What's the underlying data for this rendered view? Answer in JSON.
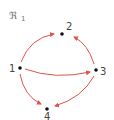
{
  "diagram": {
    "title": "ℜ",
    "title_subscript": "1",
    "edge_color": "#e0524a",
    "node_color": "#111111",
    "nodes": [
      {
        "id": "1",
        "label": "1",
        "x": 20,
        "y": 68
      },
      {
        "id": "2",
        "label": "2",
        "x": 62,
        "y": 34
      },
      {
        "id": "3",
        "label": "3",
        "x": 96,
        "y": 70
      },
      {
        "id": "4",
        "label": "4",
        "x": 47,
        "y": 109
      }
    ],
    "edges": [
      {
        "from": "1",
        "to": "2"
      },
      {
        "from": "1",
        "to": "3"
      },
      {
        "from": "1",
        "to": "4"
      },
      {
        "from": "3",
        "to": "2"
      },
      {
        "from": "3",
        "to": "4"
      }
    ]
  }
}
